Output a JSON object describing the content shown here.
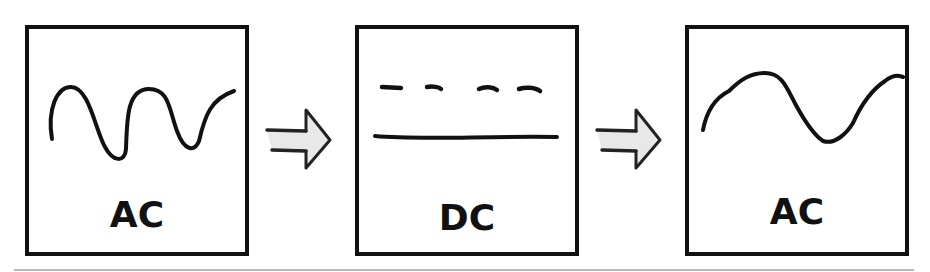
{
  "diagram": {
    "title_hint": "AC to DC to AC conversion",
    "stages": [
      {
        "id": "stage-1",
        "label": "AC",
        "signal": "ac-wave-high-frequency"
      },
      {
        "id": "stage-2",
        "label": "DC",
        "signal": "dc-dashed-and-solid-lines"
      },
      {
        "id": "stage-3",
        "label": "AC",
        "signal": "ac-wave-low-frequency"
      }
    ],
    "connectors": [
      {
        "from": "stage-1",
        "to": "stage-2",
        "icon": "right-arrow-icon"
      },
      {
        "from": "stage-2",
        "to": "stage-3",
        "icon": "right-arrow-icon"
      }
    ],
    "colors": {
      "stroke": "#111111",
      "arrow_fill": "#e8e8e8",
      "background": "#ffffff",
      "divider": "#b8b8b8"
    }
  }
}
